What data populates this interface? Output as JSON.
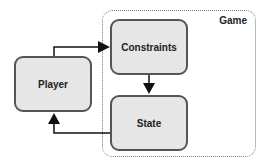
{
  "diagram": {
    "container": {
      "label": "Game"
    },
    "nodes": [
      {
        "id": "player",
        "label": "Player"
      },
      {
        "id": "constraints",
        "label": "Constraints"
      },
      {
        "id": "state",
        "label": "State"
      }
    ],
    "edges": [
      {
        "from": "player",
        "to": "constraints"
      },
      {
        "from": "constraints",
        "to": "state"
      },
      {
        "from": "state",
        "to": "player"
      }
    ]
  }
}
